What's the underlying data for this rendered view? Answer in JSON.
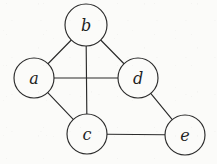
{
  "figure": {
    "kind": "undirected-graph-diagram",
    "width": 217,
    "height": 164,
    "background_color": "#fbfbf9",
    "stroke_color": "#2b2b2b",
    "node_fill_color": "#fbfbf9",
    "label_color": "#1f1f1f"
  },
  "graph": {
    "node_radius": 20,
    "nodes": [
      {
        "id": "a",
        "label": "a",
        "cx": 34,
        "cy": 78,
        "r": 20
      },
      {
        "id": "b",
        "label": "b",
        "cx": 86,
        "cy": 25,
        "r": 21
      },
      {
        "id": "c",
        "label": "c",
        "cx": 87,
        "cy": 134,
        "r": 20
      },
      {
        "id": "d",
        "label": "d",
        "cx": 138,
        "cy": 78,
        "r": 20
      },
      {
        "id": "e",
        "label": "e",
        "cx": 185,
        "cy": 135,
        "r": 20
      }
    ],
    "edges": [
      {
        "id": "a-b",
        "source": "a",
        "target": "b"
      },
      {
        "id": "b-d",
        "source": "b",
        "target": "d"
      },
      {
        "id": "b-c",
        "source": "b",
        "target": "c"
      },
      {
        "id": "a-d",
        "source": "a",
        "target": "d"
      },
      {
        "id": "a-c",
        "source": "a",
        "target": "c"
      },
      {
        "id": "d-e",
        "source": "d",
        "target": "e"
      },
      {
        "id": "c-e",
        "source": "c",
        "target": "e"
      }
    ]
  }
}
